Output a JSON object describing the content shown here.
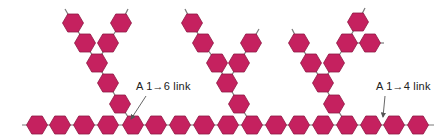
{
  "colors": {
    "unit_fill": "#c5215f",
    "unit_stroke": "#8e1944",
    "bond": "#7a7a7a",
    "label": "#222222",
    "arrow": "#555555"
  },
  "labels": {
    "branch_link": "A 1→6 link",
    "chain_link": "A 1→4 link"
  },
  "main_chain": {
    "y": 125,
    "x": [
      37,
      60,
      84,
      108,
      133,
      156,
      180,
      204,
      228,
      252,
      276,
      299,
      323,
      347,
      371,
      394,
      418
    ],
    "line_x": [
      22,
      434
    ]
  },
  "branches": [
    {
      "anchor": [
        133,
        125
      ],
      "units": [
        [
          120,
          104
        ],
        [
          108,
          83
        ],
        [
          97,
          63
        ],
        [
          85,
          43
        ],
        [
          73,
          23
        ],
        [
          108,
          43
        ],
        [
          121,
          23
        ]
      ],
      "bonds": [
        [
          133,
          125,
          120,
          104
        ],
        [
          120,
          104,
          108,
          83
        ],
        [
          108,
          83,
          97,
          63
        ],
        [
          97,
          63,
          85,
          43
        ],
        [
          85,
          43,
          73,
          23
        ],
        [
          73,
          23,
          65,
          9
        ],
        [
          97,
          63,
          108,
          43
        ],
        [
          108,
          43,
          121,
          23
        ],
        [
          121,
          23,
          128,
          9
        ]
      ]
    },
    {
      "anchor": [
        252,
        125
      ],
      "units": [
        [
          239,
          104
        ],
        [
          227,
          83
        ],
        [
          217,
          63
        ],
        [
          203,
          43
        ],
        [
          192,
          23
        ],
        [
          239,
          63
        ],
        [
          251,
          43
        ]
      ],
      "bonds": [
        [
          252,
          125,
          239,
          104
        ],
        [
          239,
          104,
          227,
          83
        ],
        [
          227,
          83,
          217,
          63
        ],
        [
          217,
          63,
          203,
          43
        ],
        [
          203,
          43,
          192,
          23
        ],
        [
          192,
          23,
          185,
          9
        ],
        [
          227,
          83,
          239,
          63
        ],
        [
          239,
          63,
          251,
          43
        ],
        [
          251,
          43,
          259,
          29
        ]
      ]
    },
    {
      "anchor": [
        347,
        125
      ],
      "units": [
        [
          334,
          104
        ],
        [
          323,
          83
        ],
        [
          311,
          63
        ],
        [
          299,
          43
        ],
        [
          334,
          63
        ],
        [
          347,
          43
        ],
        [
          358,
          22
        ],
        [
          370,
          43
        ]
      ],
      "bonds": [
        [
          347,
          125,
          334,
          104
        ],
        [
          334,
          104,
          323,
          83
        ],
        [
          323,
          83,
          311,
          63
        ],
        [
          311,
          63,
          299,
          43
        ],
        [
          299,
          43,
          292,
          29
        ],
        [
          323,
          83,
          334,
          63
        ],
        [
          334,
          63,
          347,
          43
        ],
        [
          347,
          43,
          358,
          22
        ],
        [
          358,
          22,
          365,
          8
        ],
        [
          347,
          43,
          370,
          43
        ],
        [
          370,
          43,
          384,
          43
        ]
      ]
    }
  ],
  "annotations": [
    {
      "label_key": "branch_link",
      "text_x": 136,
      "text_y": 80,
      "arrow": [
        146,
        96,
        131,
        119
      ]
    },
    {
      "label_key": "chain_link",
      "text_x": 376,
      "text_y": 80,
      "arrow": [
        385,
        96,
        383,
        117
      ]
    }
  ]
}
